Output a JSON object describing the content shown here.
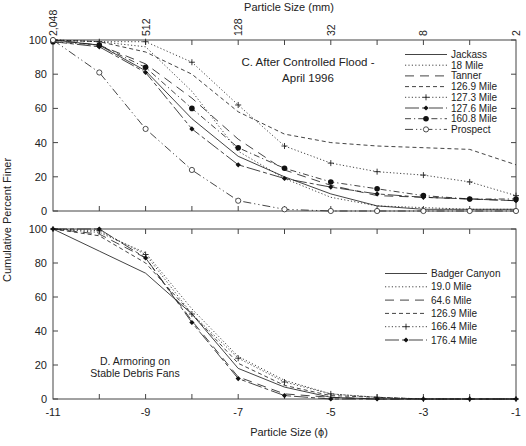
{
  "chart_data": [
    {
      "type": "line",
      "panel": "C",
      "title": "C. After Controlled Flood - April 1996",
      "title_lines": [
        "C.  After  Controlled  Flood  -",
        "April  1996"
      ],
      "xlabel_top": "Particle Size (mm)",
      "ylabel": "Cumulative Percent Finer",
      "top_ticks": [
        {
          "phi": -11,
          "label": "2,048"
        },
        {
          "phi": -9,
          "label": "512"
        },
        {
          "phi": -7,
          "label": "128"
        },
        {
          "phi": -5,
          "label": "32"
        },
        {
          "phi": -3,
          "label": "8"
        },
        {
          "phi": -1,
          "label": "2"
        }
      ],
      "x": [
        -11,
        -10,
        -9,
        -8,
        -7,
        -6,
        -5,
        -4,
        -3,
        -2,
        -1
      ],
      "xlim": [
        -11,
        -1
      ],
      "ylim": [
        0,
        100
      ],
      "yticks": [
        0,
        20,
        40,
        60,
        80,
        100
      ],
      "legend_position": "upper right",
      "series": [
        {
          "name": "Jackass",
          "style": "solid",
          "marker": "none",
          "values": [
            100,
            97,
            82,
            54,
            32,
            20,
            10,
            3,
            1,
            1,
            1
          ]
        },
        {
          "name": "18 Mile",
          "style": "dotted",
          "marker": "none",
          "values": [
            100,
            99,
            96,
            70,
            35,
            19,
            8,
            3,
            2,
            1,
            1
          ]
        },
        {
          "name": "Tanner",
          "style": "longdash",
          "marker": "none",
          "values": [
            100,
            97,
            86,
            66,
            42,
            24,
            15,
            9,
            8,
            7,
            6
          ]
        },
        {
          "name": "126.9 Mile",
          "style": "dashed",
          "marker": "none",
          "values": [
            100,
            99,
            93,
            80,
            58,
            45,
            40,
            38,
            37,
            36,
            27
          ]
        },
        {
          "name": "127.3 Mile",
          "style": "dotted",
          "marker": "plus",
          "values": [
            100,
            99,
            99,
            87,
            62,
            38,
            28,
            23,
            21,
            17,
            9
          ]
        },
        {
          "name": "127.6 Mile",
          "style": "solid-dash",
          "marker": "diamond",
          "values": [
            99,
            96,
            81,
            48,
            27,
            19,
            14,
            10,
            8,
            7,
            6
          ]
        },
        {
          "name": "160.8 Mile",
          "style": "dashdot",
          "marker": "circle-filled",
          "values": [
            99,
            97,
            84,
            60,
            37,
            25,
            17,
            13,
            9,
            7,
            7
          ]
        },
        {
          "name": "Prospect",
          "style": "dash-dot-dot",
          "marker": "circle-open",
          "values": [
            100,
            81,
            48,
            24,
            6,
            1,
            0,
            0,
            0,
            0,
            0
          ]
        }
      ]
    },
    {
      "type": "line",
      "panel": "D",
      "title": "D. Armoring on Stable Debris Fans",
      "title_lines": [
        "D. Armoring on",
        "Stable Debris Fans"
      ],
      "xlabel": "Particle Size (ϕ)",
      "ylabel": "Cumulative Percent Finer",
      "x": [
        -11,
        -10,
        -9,
        -8,
        -7,
        -6,
        -5,
        -4,
        -3,
        -2,
        -1
      ],
      "xticks": [
        {
          "phi": -11,
          "label": "-11"
        },
        {
          "phi": -9,
          "label": "-9"
        },
        {
          "phi": -7,
          "label": "-7"
        },
        {
          "phi": -5,
          "label": "-5"
        },
        {
          "phi": -3,
          "label": "-3"
        },
        {
          "phi": -1,
          "label": "-1"
        }
      ],
      "xlim": [
        -11,
        -1
      ],
      "ylim": [
        0,
        100
      ],
      "yticks": [
        0,
        20,
        40,
        60,
        80,
        100
      ],
      "legend_position": "center right",
      "series": [
        {
          "name": "Badger Canyon",
          "style": "solid",
          "marker": "none",
          "values": [
            100,
            87,
            74,
            50,
            18,
            7,
            1,
            0,
            0,
            0,
            0
          ]
        },
        {
          "name": "19.0 Mile",
          "style": "dotted",
          "marker": "none",
          "values": [
            100,
            98,
            86,
            53,
            25,
            11,
            3,
            1,
            0,
            0,
            0
          ]
        },
        {
          "name": "64.6 Mile",
          "style": "longdash",
          "marker": "none",
          "values": [
            100,
            97,
            83,
            46,
            13,
            3,
            1,
            0,
            0,
            0,
            0
          ]
        },
        {
          "name": "126.9 Mile",
          "style": "dashed",
          "marker": "none",
          "values": [
            100,
            96,
            80,
            50,
            21,
            8,
            2,
            1,
            0,
            0,
            0
          ]
        },
        {
          "name": "166.4 Mile",
          "style": "dotted",
          "marker": "plus",
          "values": [
            100,
            99,
            85,
            50,
            24,
            10,
            3,
            1,
            0,
            0,
            0
          ]
        },
        {
          "name": "176.4 Mile",
          "style": "solid-dash",
          "marker": "diamond",
          "values": [
            100,
            100,
            83,
            45,
            12,
            2,
            0,
            0,
            0,
            0,
            0
          ]
        }
      ]
    }
  ],
  "labels": {
    "top_axis_title": "Particle Size (mm)",
    "bottom_axis_title": "Particle Size (ϕ)",
    "y_axis_title": "Cumulative Percent Finer"
  }
}
